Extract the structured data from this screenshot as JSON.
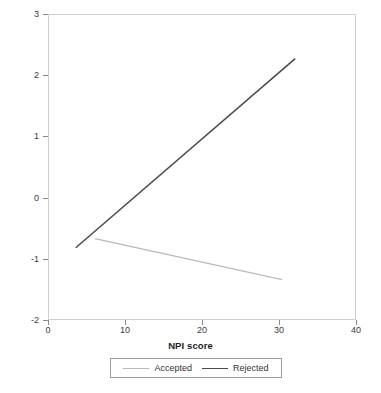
{
  "chart_data": {
    "type": "line",
    "title": "",
    "xlabel": "NPI score",
    "ylabel": "Aggression",
    "xlim": [
      0,
      40
    ],
    "ylim": [
      -2,
      3
    ],
    "xticks": [
      0,
      10,
      20,
      30,
      40
    ],
    "yticks": [
      -2,
      -1,
      0,
      1,
      2,
      3
    ],
    "xtick_labels": [
      "0",
      "10",
      "20",
      "30",
      "40"
    ],
    "ytick_labels": [
      "-2",
      "-1",
      "0",
      "1",
      "2",
      "3"
    ],
    "grid": false,
    "legend_position": "bottom-center",
    "series": [
      {
        "name": "Accepted",
        "color": "#b9b9b9",
        "line_width": 1.2,
        "x": [
          6.1,
          30.4
        ],
        "y": [
          -0.67,
          -1.34
        ]
      },
      {
        "name": "Rejected",
        "color": "#4a4a4a",
        "line_width": 1.5,
        "x": [
          3.6,
          32.1
        ],
        "y": [
          -0.82,
          2.27
        ]
      }
    ]
  },
  "axis": {
    "frame_color": "#cfcfcf",
    "tick_color": "#8a8a8a",
    "label_color": "#222222"
  }
}
